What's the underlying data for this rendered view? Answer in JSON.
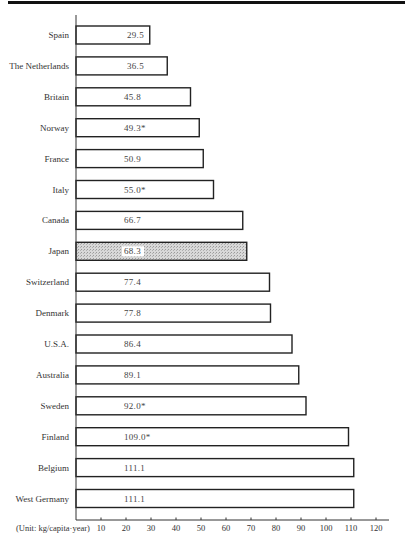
{
  "chart_data": {
    "type": "bar",
    "orientation": "horizontal",
    "title": "",
    "xlabel": "(Unit: kg/capita·year)",
    "ylabel": "",
    "xlim": [
      0,
      120
    ],
    "xticks": [
      10,
      20,
      30,
      40,
      50,
      60,
      70,
      80,
      90,
      100,
      110,
      120
    ],
    "grid": false,
    "categories": [
      "Spain",
      "The Netherlands",
      "Britain",
      "Norway",
      "France",
      "Italy",
      "Canada",
      "Japan",
      "Switzerland",
      "Denmark",
      "U.S.A.",
      "Australia",
      "Sweden",
      "Finland",
      "Belgium",
      "West Germany"
    ],
    "values": [
      29.5,
      36.5,
      45.8,
      49.3,
      50.9,
      55.0,
      66.7,
      68.3,
      77.4,
      77.8,
      86.4,
      89.1,
      92.0,
      109.0,
      111.1,
      111.1
    ],
    "value_labels": [
      "29.5",
      "36.5",
      "45.8",
      "49.3*",
      "50.9",
      "55.0*",
      "66.7",
      "68.3",
      "77.4",
      "77.8",
      "86.4",
      "89.1",
      "92.0*",
      "109.0*",
      "111.1",
      "111.1"
    ],
    "highlighted": [
      "Japan"
    ],
    "colors": {
      "bar_fill": "#ffffff",
      "bar_stroke": "#222222",
      "highlight_fill": "#d4d4d4",
      "axis": "#333333"
    }
  }
}
